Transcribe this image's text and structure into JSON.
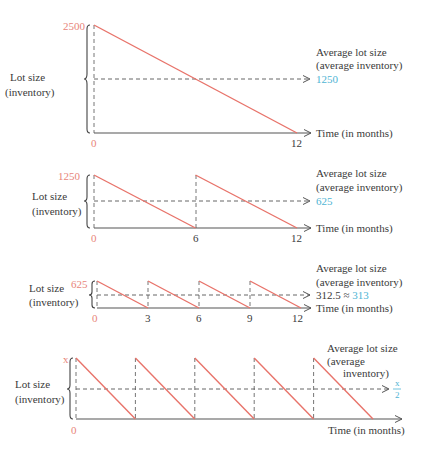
{
  "panels": [
    {
      "id": "annual",
      "y_label_line1": "Lot size",
      "y_label_line2": "(inventory)",
      "max_label": "2500",
      "max_value": 2500,
      "average_title_line1": "Average lot size",
      "average_title_line2": "(average inventory)",
      "average_value_label": "1250",
      "average_prefix": "",
      "x_axis_label": "Time (in months)",
      "x_ticks": [
        "0",
        "12"
      ],
      "x_tick_values": [
        0,
        12
      ],
      "cycles": 1,
      "period_months": 12
    },
    {
      "id": "semiannual",
      "y_label_line1": "Lot size",
      "y_label_line2": "(inventory)",
      "max_label": "1250",
      "max_value": 1250,
      "average_title_line1": "Average lot size",
      "average_title_line2": "(average inventory)",
      "average_value_label": "625",
      "average_prefix": "",
      "x_axis_label": "Time (in months)",
      "x_ticks": [
        "0",
        "6",
        "12"
      ],
      "x_tick_values": [
        0,
        6,
        12
      ],
      "cycles": 2,
      "period_months": 6
    },
    {
      "id": "quarterly",
      "y_label_line1": "Lot size",
      "y_label_line2": "(inventory)",
      "max_label": "625",
      "max_value": 625,
      "average_title_line1": "Average lot size",
      "average_title_line2": "(average inventory)",
      "average_value_label": "313",
      "average_prefix": "312.5 ≈ ",
      "x_axis_label": "Time (in months)",
      "x_ticks": [
        "0",
        "3",
        "6",
        "9",
        "12"
      ],
      "x_tick_values": [
        0,
        3,
        6,
        9,
        12
      ],
      "cycles": 4,
      "period_months": 3
    },
    {
      "id": "general",
      "y_label_line1": "Lot size",
      "y_label_line2": "(inventory)",
      "max_label": "x",
      "average_title_line1": "Average lot size",
      "average_title_line2": "(average",
      "average_title_line3": "inventory)",
      "average_fraction_numerator": "x",
      "average_fraction_denominator": "2",
      "x_axis_label": "Time (in months)",
      "x_ticks": [
        "0"
      ],
      "cycles": 5
    }
  ],
  "colors": {
    "sawtooth": "#e8736a",
    "max_label": "#e8857a",
    "average_value": "#4fb4d4",
    "axis": "#555555"
  }
}
